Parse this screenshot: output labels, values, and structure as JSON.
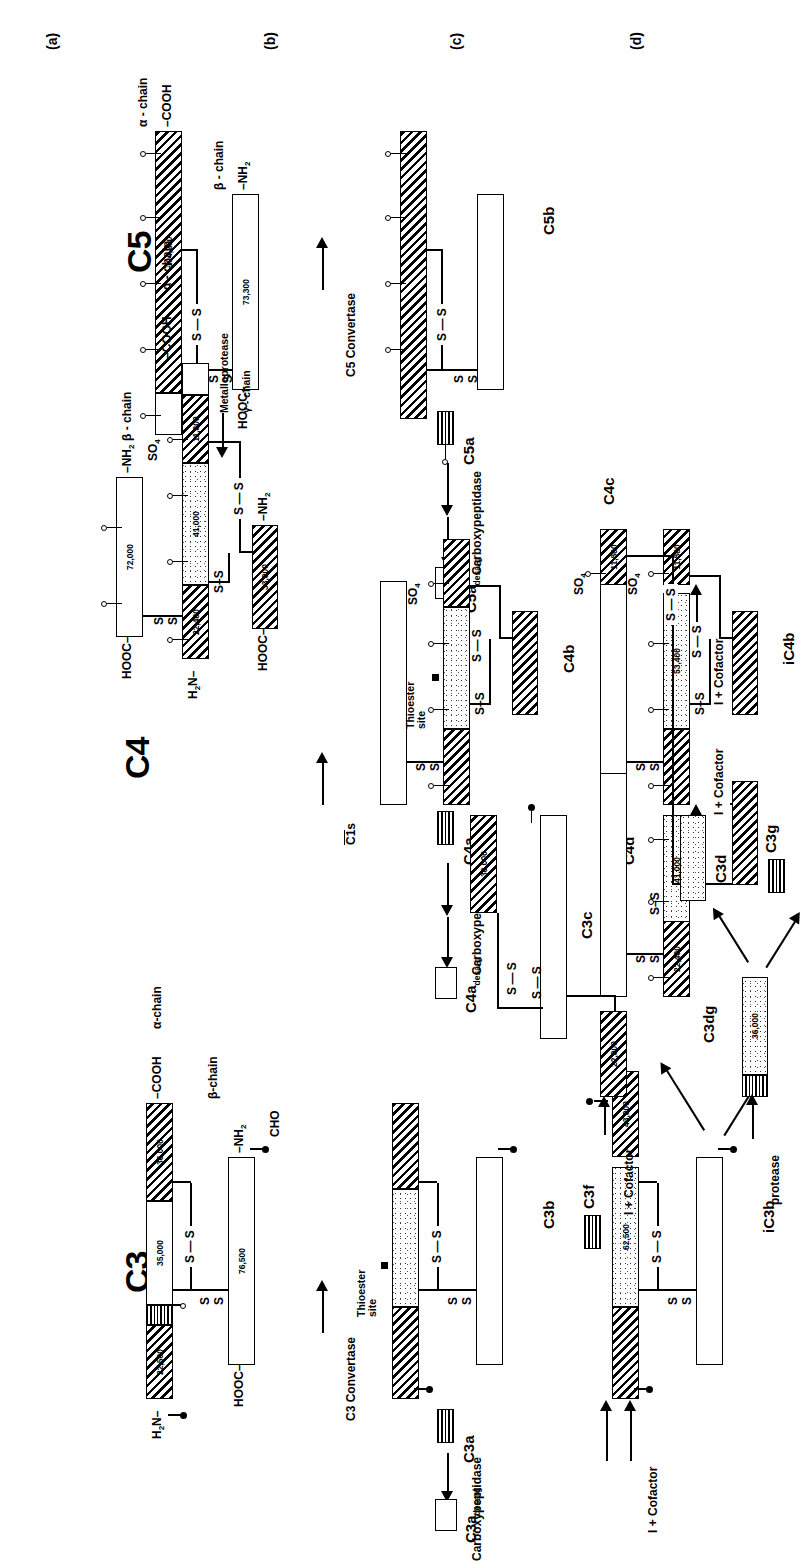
{
  "figure": {
    "type": "diagram",
    "orientation": "rotated-90-ccw"
  },
  "panels": [
    {
      "letter": "(a)",
      "description": "native molecules"
    },
    {
      "letter": "(b)",
      "description": "convertase cleavage products"
    },
    {
      "letter": "(c)",
      "description": "factor I + cofactor cleavage"
    },
    {
      "letter": "(d)",
      "description": "further degradation"
    }
  ],
  "c3": {
    "title": "C3",
    "alpha_chain_label": "α-chain",
    "beta_chain_label": "β-chain",
    "nterm_alpha": "H₂N",
    "cterm_alpha": "COOH",
    "nterm_beta": "NH₂",
    "cterm_beta": "HOOC",
    "cho_label": "CHO",
    "thioester_label": "Thioester site",
    "mw": {
      "a1": "22,500",
      "a2": "35,000",
      "a3": "36,000",
      "beta": "76,500",
      "c3c_large": "38,000",
      "c3c_small": "22,000",
      "ic3b_big": "62,500",
      "ic3b_hatch": "43,000",
      "c3dg": "36,000",
      "c3g": "8,000"
    },
    "enzymes": {
      "convertase": "C3 Convertase",
      "carboxypeptidase": "Carboxypeptidase",
      "i_cofactor": "I + Cofactor",
      "protease": "protease"
    },
    "fragments": {
      "c3a": "C3a",
      "c3a_desarg": "C3a",
      "c3a_desarg_sub": "desarg",
      "c3b": "C3b",
      "c3f": "C3f",
      "ic3b": "iC3b",
      "c3c": "C3c",
      "c3dg": "C3dg",
      "c3d": "C3d",
      "c3g": "C3g"
    }
  },
  "c4": {
    "title": "C4",
    "alpha_chain_label": "α - chain",
    "beta_chain_label": "β - chain",
    "gamma_chain_label": "γ - chain",
    "nterm_alpha": "H₂N",
    "cterm_alpha": "COOH",
    "nterm_beta": "NH₂",
    "cterm_beta": "HOOC",
    "nterm_gamma": "NH₂",
    "cterm_gamma": "HOOC",
    "so4_label": "SO₄",
    "thioester_label": "Thioester site",
    "metalloprotease_label": "Metalloprotease",
    "mw": {
      "beta": "72,000",
      "a1": "22,400",
      "a2": "41,000",
      "a3": "11,800",
      "gamma": "33,000",
      "ic4b_big": "53,400",
      "ic4b_small": "11,800",
      "c4d": "41,000",
      "c4c_hatch": "11,800",
      "c4c_small": "22,400"
    },
    "enzymes": {
      "c1s": "C1s",
      "carboxypeptidase": "Carboxypeptidase",
      "i_cofactor": "I + Cofactor"
    },
    "fragments": {
      "c4a": "C4a",
      "c4a_desarg": "C4a",
      "c4a_desarg_sub": "desarg",
      "c4b": "C4b",
      "ic4b": "iC4b",
      "c4d": "C4d",
      "c4c": "C4c"
    }
  },
  "c5": {
    "title": "C5",
    "alpha_chain_label": "α - chain",
    "beta_chain_label": "β - chain",
    "nterm_alpha": "H₂N",
    "cterm_alpha": "COOH",
    "nterm_beta": "NH₂",
    "cterm_beta": "HOOC",
    "mw": {
      "alpha": "104,200",
      "beta": "73,300"
    },
    "enzymes": {
      "convertase": "C5 Convertase",
      "carboxypeptidase": "Carboxypeptidase"
    },
    "fragments": {
      "c5a": "C5a",
      "c5a_desarg": "C5a",
      "c5a_desarg_sub": "desarg",
      "c5b": "C5b"
    }
  },
  "legend": {
    "disulfide": "S—S",
    "s": "S"
  }
}
